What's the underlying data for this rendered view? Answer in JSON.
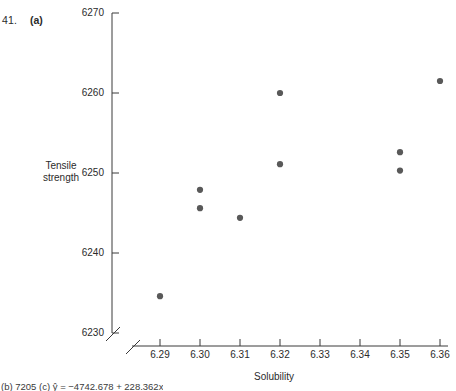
{
  "figure": {
    "exercise_number": "41.",
    "part_label": "(a)",
    "footer_note": "(b) 7205  (c)  ŷ = −4742.678 + 228.362x"
  },
  "chart_data": {
    "type": "scatter",
    "title": "",
    "xlabel": "Solubility",
    "ylabel": "Tensile\nstrength",
    "ylabel_line1": "Tensile",
    "ylabel_line2": "strength",
    "xlim": [
      6.285,
      6.365
    ],
    "ylim": [
      6230,
      6270
    ],
    "grid": false,
    "legend": null,
    "axis_break_x": true,
    "axis_break_y": true,
    "xticks": [
      6.29,
      6.3,
      6.31,
      6.32,
      6.33,
      6.34,
      6.35,
      6.36
    ],
    "xtick_labels": [
      "6.29",
      "6.30",
      "6.31",
      "6.32",
      "6.33",
      "6.34",
      "6.35",
      "6.36"
    ],
    "yticks": [
      6230,
      6240,
      6250,
      6260,
      6270
    ],
    "ytick_labels": [
      "6230",
      "6240",
      "6250",
      "6260",
      "6270"
    ],
    "marker_color": "#595959",
    "marker_size": 4.2,
    "x": [
      6.29,
      6.3,
      6.3,
      6.31,
      6.32,
      6.32,
      6.35,
      6.35,
      6.36
    ],
    "y": [
      6234.6,
      6247.9,
      6245.6,
      6244.4,
      6260.0,
      6251.1,
      6252.6,
      6250.3,
      6261.5
    ],
    "points": [
      {
        "x": 6.29,
        "y": 6234.6
      },
      {
        "x": 6.3,
        "y": 6247.9
      },
      {
        "x": 6.3,
        "y": 6245.6
      },
      {
        "x": 6.31,
        "y": 6244.4
      },
      {
        "x": 6.32,
        "y": 6260.0
      },
      {
        "x": 6.32,
        "y": 6251.1
      },
      {
        "x": 6.35,
        "y": 6252.6
      },
      {
        "x": 6.35,
        "y": 6250.3
      },
      {
        "x": 6.36,
        "y": 6261.5
      }
    ]
  }
}
